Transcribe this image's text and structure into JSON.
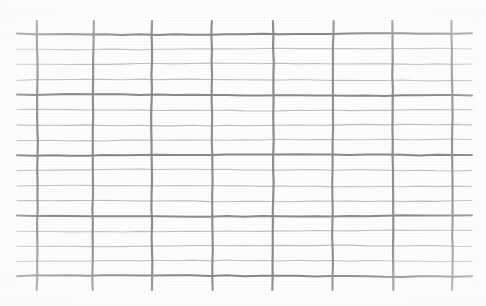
{
  "image": {
    "title": "Welded wire mesh grid scan",
    "width": 486,
    "height": 306,
    "background_color": "#ffffff",
    "description": "Scanned rectangular wire-mesh / graph-paper grid on white background"
  },
  "chart_data": {
    "type": "table",
    "subtitle": "",
    "xlabel": "",
    "ylabel": "",
    "grid": true,
    "legend_position": "none",
    "xlim": [
      0,
      486
    ],
    "ylim": [
      0,
      306
    ],
    "tick_labels_x": [],
    "tick_labels_y": [],
    "annotations": [],
    "colors": {
      "background": "#ffffff",
      "major_line": "#8c8c8c",
      "minor_line": "#b9b9b9",
      "vertical_line": "#8a8a8a",
      "ink_shadow": "#6f6f6f"
    },
    "geometry": {
      "grid_left": 27,
      "grid_right": 462,
      "grid_top": 34,
      "grid_bottom": 276,
      "vertical_overshoot_top": 13,
      "vertical_overshoot_bottom": 14,
      "horizontal_overhang_left": 10,
      "horizontal_overhang_right": 10,
      "columns": 7,
      "rows": 16,
      "major_row_interval": 4
    },
    "vertical_lines": [
      {
        "index": 0,
        "x": 37,
        "width": 2.2,
        "color": "#858585",
        "weight": "major"
      },
      {
        "index": 1,
        "x": 93,
        "width": 2.2,
        "color": "#8a8a8a",
        "weight": "major"
      },
      {
        "index": 2,
        "x": 152,
        "width": 2.2,
        "color": "#888888",
        "weight": "major"
      },
      {
        "index": 3,
        "x": 212,
        "width": 2.2,
        "color": "#8a8a8a",
        "weight": "major"
      },
      {
        "index": 4,
        "x": 273,
        "width": 2.2,
        "color": "#878787",
        "weight": "major"
      },
      {
        "index": 5,
        "x": 333,
        "width": 2.2,
        "color": "#8c8c8c",
        "weight": "major"
      },
      {
        "index": 6,
        "x": 393,
        "width": 2.2,
        "color": "#8a8a8a",
        "weight": "major"
      },
      {
        "index": 7,
        "x": 452,
        "width": 2.2,
        "color": "#8d8d8d",
        "weight": "major"
      }
    ],
    "horizontal_lines": [
      {
        "index": 0,
        "y": 34,
        "height": 2.0,
        "color": "#828282",
        "weight": "major"
      },
      {
        "index": 1,
        "y": 49,
        "height": 1.1,
        "color": "#bcbcbc",
        "weight": "minor"
      },
      {
        "index": 2,
        "y": 64,
        "height": 1.1,
        "color": "#b6b6b6",
        "weight": "minor"
      },
      {
        "index": 3,
        "y": 80,
        "height": 1.1,
        "color": "#bababa",
        "weight": "minor"
      },
      {
        "index": 4,
        "y": 95,
        "height": 2.0,
        "color": "#858585",
        "weight": "major"
      },
      {
        "index": 5,
        "y": 110,
        "height": 1.1,
        "color": "#bababa",
        "weight": "minor"
      },
      {
        "index": 6,
        "y": 125,
        "height": 1.1,
        "color": "#b5b5b5",
        "weight": "minor"
      },
      {
        "index": 7,
        "y": 140,
        "height": 1.1,
        "color": "#bcbcbc",
        "weight": "minor"
      },
      {
        "index": 8,
        "y": 155,
        "height": 2.0,
        "color": "#838383",
        "weight": "major"
      },
      {
        "index": 9,
        "y": 170,
        "height": 1.1,
        "color": "#b8b8b8",
        "weight": "minor"
      },
      {
        "index": 10,
        "y": 186,
        "height": 1.1,
        "color": "#bcbcbc",
        "weight": "minor"
      },
      {
        "index": 11,
        "y": 201,
        "height": 1.1,
        "color": "#b6b6b6",
        "weight": "minor"
      },
      {
        "index": 12,
        "y": 216,
        "height": 2.0,
        "color": "#878787",
        "weight": "major"
      },
      {
        "index": 13,
        "y": 231,
        "height": 1.1,
        "color": "#bababa",
        "weight": "minor"
      },
      {
        "index": 14,
        "y": 246,
        "height": 1.1,
        "color": "#b7b7b7",
        "weight": "minor"
      },
      {
        "index": 15,
        "y": 261,
        "height": 1.1,
        "color": "#bdbdbd",
        "weight": "minor"
      },
      {
        "index": 16,
        "y": 276,
        "height": 2.0,
        "color": "#828282",
        "weight": "major"
      }
    ]
  }
}
